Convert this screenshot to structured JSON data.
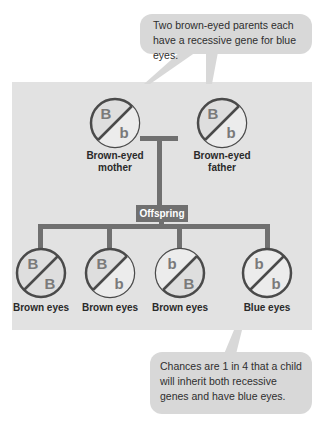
{
  "callouts": {
    "top": "Two brown-eyed parents each have a recessive gene for blue eyes.",
    "bottom": "Chances are 1 in 4 that a child will inherit both recessive genes and have blue eyes."
  },
  "parents": [
    {
      "id": "mother",
      "alleles": [
        "B",
        "b"
      ],
      "label_line1": "Brown-eyed",
      "label_line2": "mother"
    },
    {
      "id": "father",
      "alleles": [
        "B",
        "b"
      ],
      "label_line1": "Brown-eyed",
      "label_line2": "father"
    }
  ],
  "offspring_label": "Offspring",
  "children": [
    {
      "alleles": [
        "B",
        "B"
      ],
      "label": "Brown eyes"
    },
    {
      "alleles": [
        "B",
        "b"
      ],
      "label": "Brown eyes"
    },
    {
      "alleles": [
        "b",
        "B"
      ],
      "label": "Brown eyes"
    },
    {
      "alleles": [
        "b",
        "b"
      ],
      "label": "Blue eyes"
    }
  ],
  "colors": {
    "panel": "#e2e2e2",
    "callout": "#d8d8d8",
    "connector": "#707070",
    "circle_stroke": "#4a4a4a",
    "allele_text": "#7a7a7a"
  }
}
